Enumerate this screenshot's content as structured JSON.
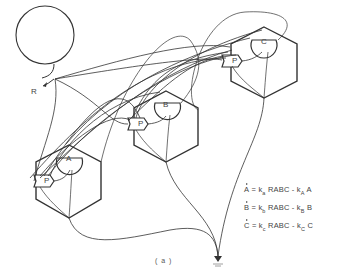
{
  "diagram": {
    "type": "reaction-network",
    "source_label": "R",
    "nodes": [
      {
        "id": "A",
        "label": "A",
        "port_label": "P"
      },
      {
        "id": "B",
        "label": "B",
        "port_label": "P"
      },
      {
        "id": "C",
        "label": "C",
        "port_label": "P"
      }
    ],
    "equations": [
      {
        "lhs": "A",
        "rate1": "k",
        "sub1": "a",
        "mid": "RABC -",
        "rate2": "k",
        "sub2": "A",
        "tail": "A"
      },
      {
        "lhs": "B",
        "rate1": "k",
        "sub1": "b",
        "mid": "RABC -",
        "rate2": "k",
        "sub2": "B",
        "tail": "B"
      },
      {
        "lhs": "C",
        "rate1": "k",
        "sub1": "c",
        "mid": "RABC -",
        "rate2": "k",
        "sub2": "C",
        "tail": "C"
      }
    ],
    "equals": "=",
    "caption": "( a )",
    "colors": {
      "stroke": "#333333",
      "background": "#ffffff"
    }
  }
}
